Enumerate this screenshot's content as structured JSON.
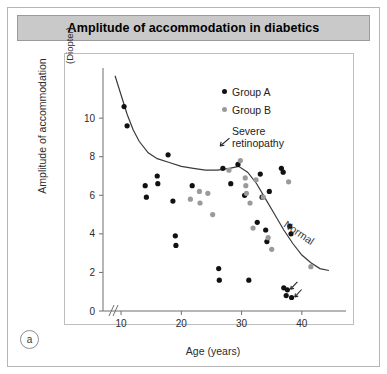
{
  "figure": {
    "title": "Amplitude of accommodation in diabetics",
    "panel_label": "a"
  },
  "legend": {
    "items": [
      {
        "label": "Group A",
        "marker": "black-dot",
        "color": "#111111"
      },
      {
        "label": "Group B",
        "marker": "gray-dot",
        "color": "#9a9a9a"
      },
      {
        "label": "Severe\nretinopathy",
        "label_line1": "Severe",
        "label_line2": "retinopathy",
        "marker": "arrow",
        "color": "#222222"
      }
    ]
  },
  "chart_data": {
    "type": "scatter",
    "title": "Amplitude of accommodation in diabetics",
    "xlabel": "Age (years)",
    "ylabel": "Amplitude of accommodation",
    "yunit": "(Diopter)",
    "xlim": [
      7,
      46
    ],
    "ylim": [
      0,
      12.6
    ],
    "xticks": [
      10,
      20,
      30,
      40
    ],
    "yticks": [
      0,
      2,
      4,
      6,
      8,
      10
    ],
    "axis_break_x": true,
    "grid": false,
    "legend_position": "upper-right-inside",
    "series": [
      {
        "name": "Group A",
        "color": "#111111",
        "points": [
          [
            10.5,
            10.6
          ],
          [
            11.0,
            9.6
          ],
          [
            14.0,
            6.5
          ],
          [
            14.2,
            5.9
          ],
          [
            16.0,
            7.0
          ],
          [
            16.1,
            6.6
          ],
          [
            17.8,
            8.1
          ],
          [
            18.6,
            5.7
          ],
          [
            19.0,
            3.9
          ],
          [
            19.1,
            3.4
          ],
          [
            21.8,
            6.5
          ],
          [
            26.2,
            2.2
          ],
          [
            26.3,
            1.6
          ],
          [
            26.9,
            7.4
          ],
          [
            28.2,
            6.6
          ],
          [
            29.4,
            7.6
          ],
          [
            30.5,
            6.0
          ],
          [
            31.2,
            1.6
          ],
          [
            32.6,
            4.6
          ],
          [
            33.1,
            7.1
          ],
          [
            33.4,
            5.9
          ],
          [
            34.0,
            4.2
          ],
          [
            34.2,
            3.6
          ],
          [
            34.6,
            6.2
          ],
          [
            36.6,
            7.4
          ],
          [
            36.9,
            7.2
          ],
          [
            37.0,
            1.2
          ],
          [
            37.6,
            1.1
          ],
          [
            37.4,
            0.8
          ],
          [
            38.0,
            4.4
          ],
          [
            38.2,
            4.0
          ],
          [
            38.3,
            0.7
          ]
        ]
      },
      {
        "name": "Group B",
        "color": "#9a9a9a",
        "points": [
          [
            21.5,
            5.8
          ],
          [
            23.0,
            6.2
          ],
          [
            23.1,
            5.6
          ],
          [
            24.4,
            6.1
          ],
          [
            25.2,
            5.0
          ],
          [
            27.9,
            7.3
          ],
          [
            29.8,
            7.8
          ],
          [
            30.6,
            6.9
          ],
          [
            30.7,
            6.5
          ],
          [
            30.8,
            6.1
          ],
          [
            31.4,
            5.6
          ],
          [
            31.9,
            4.3
          ],
          [
            32.4,
            6.8
          ],
          [
            33.6,
            5.9
          ],
          [
            34.4,
            3.8
          ],
          [
            35.0,
            3.2
          ],
          [
            37.8,
            6.7
          ],
          [
            41.5,
            2.3
          ]
        ]
      }
    ],
    "annotations": [
      {
        "label": "Normal",
        "type": "curve-label",
        "description": "reference decline curve for normal subjects"
      },
      {
        "label": "severe retinopathy arrow",
        "type": "arrow",
        "x": 37.6,
        "y": 1.1
      },
      {
        "label": "severe retinopathy arrow",
        "type": "arrow",
        "x": 38.3,
        "y": 0.7
      }
    ],
    "normal_curve": {
      "name": "Normal",
      "points": [
        [
          9.0,
          12.2
        ],
        [
          10.0,
          11.2
        ],
        [
          11.0,
          10.2
        ],
        [
          12.0,
          9.4
        ],
        [
          13.0,
          8.8
        ],
        [
          14.5,
          8.2
        ],
        [
          16.0,
          7.9
        ],
        [
          18.0,
          7.7
        ],
        [
          20.0,
          7.5
        ],
        [
          22.0,
          7.4
        ],
        [
          24.0,
          7.3
        ],
        [
          26.0,
          7.3
        ],
        [
          28.0,
          7.4
        ],
        [
          29.5,
          7.5
        ],
        [
          31.0,
          7.2
        ],
        [
          32.5,
          6.6
        ],
        [
          34.0,
          5.8
        ],
        [
          35.5,
          5.0
        ],
        [
          37.0,
          4.2
        ],
        [
          38.5,
          3.5
        ],
        [
          40.0,
          2.9
        ],
        [
          41.5,
          2.5
        ],
        [
          43.0,
          2.2
        ],
        [
          44.5,
          2.1
        ]
      ]
    }
  }
}
